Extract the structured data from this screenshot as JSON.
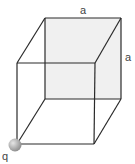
{
  "diagram": {
    "type": "cube-with-point-charge",
    "edge_label_top": "a",
    "edge_label_side": "a",
    "charge_label": "q",
    "colors": {
      "edge": "#2a2a2a",
      "back_face": "#f0f0f0",
      "charge_light": "#d8d8d8",
      "charge_dark": "#8a8a8a",
      "label": "#444444"
    },
    "vertices": {
      "front_top_left": [
        17,
        63
      ],
      "front_top_right": [
        95,
        63
      ],
      "front_bottom_left": [
        17,
        144
      ],
      "front_bottom_right": [
        94,
        144
      ],
      "back_top_left": [
        45,
        18
      ],
      "back_top_right": [
        121,
        18
      ],
      "back_bottom_left": [
        45,
        99
      ],
      "back_bottom_right": [
        121,
        99
      ]
    }
  }
}
